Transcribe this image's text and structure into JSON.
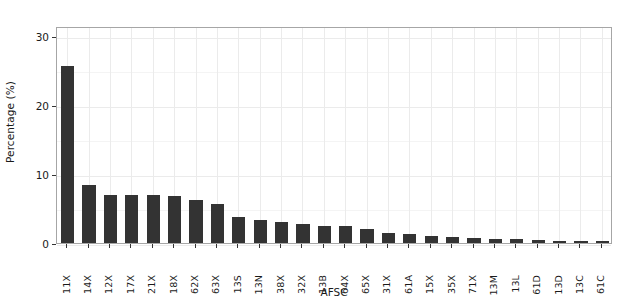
{
  "chart_data": {
    "type": "bar",
    "title": "",
    "xlabel": "AFSC",
    "ylabel": "Percentage (%)",
    "ylim": [
      0,
      31.5
    ],
    "yticks": [
      0,
      10,
      20,
      30
    ],
    "ytick_labels": [
      "0",
      "10",
      "20",
      "30"
    ],
    "grid": true,
    "legend": "none",
    "bar_color": "#333333",
    "panel_border_color": "#a6a6a6",
    "grid_color": "#ebebeb",
    "background_color": "#ffffff",
    "categories": [
      "11X",
      "14X",
      "12X",
      "17X",
      "21X",
      "18X",
      "62X",
      "63X",
      "13S",
      "13N",
      "38X",
      "32X",
      "13B",
      "64X",
      "65X",
      "31X",
      "61A",
      "15X",
      "35X",
      "71X",
      "13M",
      "13L",
      "61D",
      "13D",
      "13C",
      "61C"
    ],
    "values": [
      25.7,
      8.4,
      6.9,
      6.9,
      6.9,
      6.8,
      6.3,
      5.6,
      3.8,
      3.3,
      3.0,
      2.8,
      2.5,
      2.4,
      2.1,
      1.5,
      1.3,
      1.0,
      0.9,
      0.8,
      0.6,
      0.6,
      0.5,
      0.3,
      0.3,
      0.3
    ]
  },
  "axes": {
    "y_title": "Percentage (%)",
    "x_title": "AFSC"
  }
}
